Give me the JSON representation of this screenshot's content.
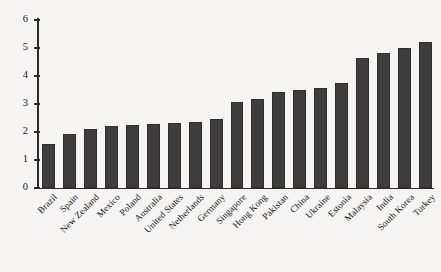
{
  "chart_data": {
    "type": "bar",
    "title": "",
    "subtitle": "",
    "xlabel": "",
    "ylabel": "",
    "ylim": [
      0,
      6
    ],
    "yticks": [
      0,
      1,
      2,
      3,
      4,
      5,
      6
    ],
    "ytick_labels": [
      "0",
      "1",
      "2",
      "3",
      "4",
      "5",
      "6"
    ],
    "grid": false,
    "legend": null,
    "legend_position": "none",
    "orientation": "vertical",
    "bar_color": "#3d3d3d",
    "background_color": "#f5f4f2",
    "axis_color": "#2b2b2b",
    "categories": [
      "Brazil",
      "Spain",
      "New Zealand",
      "Mexico",
      "Poland",
      "Australia",
      "United States",
      "Netherlands",
      "Germany",
      "Singapore",
      "Hong Kong",
      "Pakistan",
      "China",
      "Ukraine",
      "Estonia",
      "Malaysia",
      "India",
      "South Korea",
      "Turkey"
    ],
    "values": [
      1.57,
      1.93,
      2.11,
      2.21,
      2.25,
      2.29,
      2.32,
      2.36,
      2.46,
      3.07,
      3.18,
      3.43,
      3.5,
      3.57,
      3.75,
      4.64,
      4.82,
      5.0,
      5.21
    ]
  }
}
